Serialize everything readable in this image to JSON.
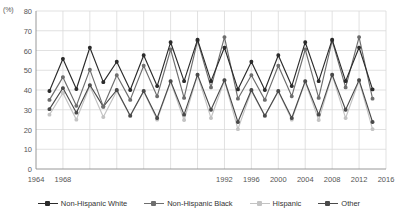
{
  "chart_data": {
    "type": "line",
    "title": "",
    "xlabel": "",
    "ylabel": "(%)",
    "yunit_label": "(%)",
    "xlim": [
      1964,
      2016
    ],
    "ylim": [
      0,
      80
    ],
    "ytick_step": 10,
    "xtick_step": 4,
    "grid": true,
    "legend_position": "bottom",
    "yticks": [
      "80",
      "70",
      "60",
      "50",
      "40",
      "30",
      "20",
      "10",
      "0"
    ],
    "xticks": [
      "1964",
      "1968",
      "1992",
      "1996",
      "2000",
      "2004",
      "2008",
      "2012",
      "2016"
    ],
    "xtick_values": [
      1964,
      1968,
      1992,
      1996,
      2000,
      2004,
      2008,
      2012,
      2016
    ],
    "x": [
      1966,
      1968,
      1970,
      1972,
      1974,
      1976,
      1978,
      1980,
      1982,
      1984,
      1986,
      1988,
      1990,
      1992,
      1994,
      1996,
      1998,
      2000,
      2002,
      2004,
      2006,
      2008,
      2010,
      2012,
      2014
    ],
    "series": [
      {
        "name": "Non-Hispanic White",
        "color": "#2b2b2b",
        "values": [
          39.5,
          55.8,
          40.5,
          61.5,
          44.0,
          54.3,
          40.0,
          57.6,
          42.0,
          64.2,
          44.5,
          65.5,
          44.5,
          61.5,
          40.3,
          54.3,
          40.0,
          57.6,
          42.0,
          64.2,
          44.5,
          65.5,
          44.5,
          61.5,
          40.3
        ]
      },
      {
        "name": "Non-Hispanic Black",
        "color": "#6e6e6e",
        "values": [
          35.0,
          46.5,
          32.0,
          50.3,
          31.6,
          47.5,
          35.0,
          52.3,
          36.8,
          60.5,
          36.0,
          65.0,
          41.3,
          66.8,
          35.6,
          47.5,
          35.0,
          52.3,
          36.8,
          60.5,
          36.0,
          65.0,
          41.3,
          66.8,
          35.6
        ]
      },
      {
        "name": "Hispanic",
        "color": "#c3c3c3",
        "values": [
          27.5,
          38.5,
          25.0,
          42.0,
          26.3,
          39.5,
          26.8,
          39.3,
          25.0,
          44.2,
          24.8,
          47.5,
          25.8,
          44.8,
          20.2,
          39.5,
          26.8,
          39.3,
          25.0,
          44.2,
          24.8,
          47.5,
          25.8,
          44.8,
          20.2
        ]
      },
      {
        "name": "Other",
        "color": "#4a4a4a",
        "values": [
          30.3,
          41.0,
          28.5,
          42.5,
          31.6,
          40.0,
          27.0,
          39.5,
          25.8,
          44.5,
          27.5,
          47.8,
          30.0,
          45.0,
          23.8,
          40.0,
          27.0,
          39.5,
          25.8,
          44.5,
          27.5,
          47.8,
          30.0,
          45.0,
          23.8
        ]
      }
    ],
    "plot_series_order": [
      "Non-Hispanic White",
      "Non-Hispanic Black",
      "Hispanic",
      "Other"
    ]
  },
  "legend": {
    "items": [
      {
        "label": "Non-Hispanic White",
        "color": "#2b2b2b"
      },
      {
        "label": "Non-Hispanic Black",
        "color": "#6e6e6e"
      },
      {
        "label": "Hispanic",
        "color": "#c3c3c3"
      },
      {
        "label": "Other",
        "color": "#4a4a4a"
      }
    ]
  },
  "colors": {
    "grid": "#d9d9d9",
    "axis": "#8c8c8c",
    "text": "#555555",
    "background": "#ffffff"
  }
}
